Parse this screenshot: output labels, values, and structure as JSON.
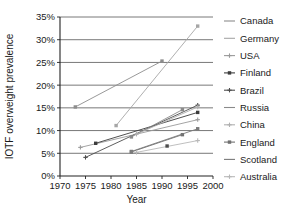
{
  "chart_data": {
    "type": "line",
    "title": "",
    "xlabel": "Year",
    "ylabel": "IOTF overweight prevalence",
    "xlim": [
      1970,
      2000
    ],
    "ylim": [
      0,
      35
    ],
    "xticks": [
      1970,
      1975,
      1980,
      1985,
      1990,
      1995,
      2000
    ],
    "xtick_labels": [
      "1970",
      "1975",
      "1980",
      "1985",
      "1990",
      "1995",
      "2000"
    ],
    "yticks": [
      0,
      5,
      10,
      15,
      20,
      25,
      30,
      35
    ],
    "ytick_labels": [
      "0%",
      "5%",
      "10%",
      "15%",
      "20%",
      "25%",
      "30%",
      "35%"
    ],
    "grid": "horizontal",
    "legend_position": "right",
    "series": [
      {
        "name": "Canada",
        "color": "#8d8d8d",
        "marker": "square",
        "x": [
          1973,
          1990
        ],
        "y": [
          15.2,
          25.3
        ]
      },
      {
        "name": "Germany",
        "color": "#a6a6a6",
        "marker": "square",
        "x": [
          1981,
          1997
        ],
        "y": [
          11.1,
          33.0
        ]
      },
      {
        "name": "USA",
        "color": "#9a9a9a",
        "marker": "plus",
        "x": [
          1974,
          1997
        ],
        "y": [
          6.3,
          12.4
        ]
      },
      {
        "name": "Finland",
        "color": "#3c3c3c",
        "marker": "square",
        "x": [
          1977,
          1997
        ],
        "y": [
          7.2,
          14.0
        ]
      },
      {
        "name": "Brazil",
        "color": "#4d4d4d",
        "marker": "plus",
        "x": [
          1975,
          1997
        ],
        "y": [
          4.1,
          15.6
        ]
      },
      {
        "name": "Russia",
        "color": "#8a8a8a",
        "marker": "square",
        "x": [
          1984,
          1994
        ],
        "y": [
          8.6,
          14.6
        ]
      },
      {
        "name": "China",
        "color": "#b0b0b0",
        "marker": "plus",
        "x": [
          1985,
          1997
        ],
        "y": [
          9.2,
          15.2
        ]
      },
      {
        "name": "England",
        "color": "#707070",
        "marker": "square",
        "x": [
          1984,
          1994
        ],
        "y": [
          5.3,
          9.1
        ]
      },
      {
        "name": "Scotland",
        "color": "#7a7a7a",
        "marker": "square",
        "x": [
          1984,
          1997
        ],
        "y": [
          5.4,
          10.4
        ]
      },
      {
        "name": "Australia",
        "color": "#b8b8b8",
        "marker": "plus",
        "x": [
          1985,
          1997
        ],
        "y": [
          5.2,
          7.8
        ]
      }
    ],
    "extra_points": [
      {
        "series": "Canada",
        "x": 1991,
        "y": 6.6
      }
    ]
  }
}
